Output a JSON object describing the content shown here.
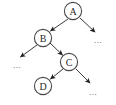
{
  "diagram": {
    "type": "binary-tree",
    "canvas": {
      "width": 116,
      "height": 105,
      "background": "#ffffff"
    },
    "style": {
      "node_stroke": "#4a4a4a",
      "node_fill": "#ffffff",
      "edge_color": "#3a3a3a",
      "text_color": "#2b2b2b",
      "node_radius": 9
    },
    "nodes": [
      {
        "id": "A",
        "label": "A",
        "cx": 73,
        "cy": 11
      },
      {
        "id": "B",
        "label": "B",
        "cx": 43,
        "cy": 38
      },
      {
        "id": "C",
        "label": "C",
        "cx": 69,
        "cy": 62
      },
      {
        "id": "D",
        "label": "D",
        "cx": 43,
        "cy": 86
      }
    ],
    "edges": [
      {
        "from": "A",
        "to": "B",
        "direction": "down-left",
        "x1": 68,
        "y1": 19,
        "x2": 49,
        "y2": 32
      },
      {
        "from": "A",
        "to": "ellipsis-a-right",
        "direction": "down-right",
        "x1": 80,
        "y1": 18,
        "x2": 96,
        "y2": 33
      },
      {
        "from": "B",
        "to": "ellipsis-b-left",
        "direction": "down-left",
        "x1": 37,
        "y1": 45,
        "x2": 19,
        "y2": 58
      },
      {
        "from": "B",
        "to": "C",
        "direction": "down-right",
        "x1": 49,
        "y1": 44,
        "x2": 63,
        "y2": 56
      },
      {
        "from": "C",
        "to": "D",
        "direction": "down-left",
        "x1": 63,
        "y1": 69,
        "x2": 49,
        "y2": 80
      },
      {
        "from": "C",
        "to": "ellipsis-c-right",
        "direction": "down-right",
        "x1": 76,
        "y1": 69,
        "x2": 91,
        "y2": 84
      }
    ],
    "ellipses": [
      {
        "id": "ellipsis-a-right",
        "text": "...",
        "x": 98,
        "y": 40
      },
      {
        "id": "ellipsis-b-left",
        "text": "...",
        "x": 17,
        "y": 65
      },
      {
        "id": "ellipsis-c-right",
        "text": "...",
        "x": 93,
        "y": 92
      }
    ]
  }
}
